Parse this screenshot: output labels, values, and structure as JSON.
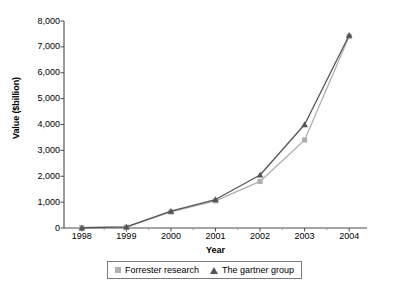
{
  "chart_data": {
    "type": "line",
    "title": "",
    "xlabel": "Year",
    "ylabel": "Value ($billion)",
    "categories": [
      "1998",
      "1999",
      "2000",
      "2001",
      "2002",
      "2003",
      "2004"
    ],
    "x": [
      1998,
      1999,
      2000,
      2001,
      2002,
      2003,
      2004
    ],
    "xlim": [
      1997.6,
      2004.4
    ],
    "ylim": [
      0,
      8000
    ],
    "yticks": [
      0,
      1000,
      2000,
      3000,
      4000,
      5000,
      6000,
      7000,
      8000
    ],
    "ytick_labels": [
      "0",
      "1,000",
      "2,000",
      "3,000",
      "4,000",
      "5,000",
      "6,000",
      "7,000",
      "8,000"
    ],
    "grid": false,
    "legend_position": "bottom-center",
    "series": [
      {
        "name": "Forrester research",
        "marker": "square",
        "color": "#b0b0b0",
        "values": [
          10,
          30,
          620,
          1050,
          1800,
          3400,
          7400
        ]
      },
      {
        "name": "The gartner group",
        "marker": "triangle",
        "color": "#555555",
        "values": [
          10,
          40,
          650,
          1100,
          2050,
          4000,
          7450
        ]
      }
    ]
  },
  "legend": {
    "entries": [
      {
        "label": "Forrester research",
        "marker": "square",
        "color": "#b0b0b0"
      },
      {
        "label": "The gartner group",
        "marker": "triangle",
        "color": "#555555"
      }
    ]
  },
  "axes": {
    "y_title": "Value ($billion)",
    "x_title": "Year"
  }
}
